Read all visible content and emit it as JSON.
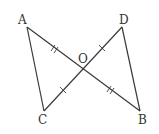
{
  "diagram": {
    "type": "geometry",
    "points": {
      "A": {
        "label": "A",
        "x": 27,
        "y": 27
      },
      "D": {
        "label": "D",
        "x": 122,
        "y": 27
      },
      "O": {
        "label": "O",
        "x": 83,
        "y": 69
      },
      "C": {
        "label": "C",
        "x": 44,
        "y": 111
      },
      "B": {
        "label": "B",
        "x": 140,
        "y": 111
      }
    },
    "segments": [
      "AB",
      "CD",
      "AC",
      "DB"
    ],
    "equal_marks": {
      "double_tick": [
        "AO",
        "OB"
      ],
      "single_tick": [
        "CO",
        "OD"
      ]
    }
  }
}
